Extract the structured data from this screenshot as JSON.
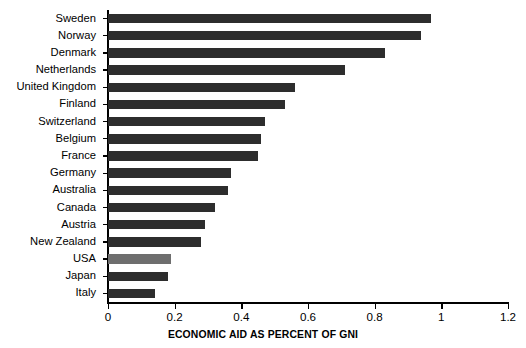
{
  "chart_data": {
    "type": "bar",
    "orientation": "horizontal",
    "title": "",
    "xlabel": "ECONOMIC AID AS PERCENT OF GNI",
    "ylabel": "",
    "xlim": [
      0,
      1.2
    ],
    "xticks": [
      "0",
      "0.2",
      "0.4",
      "0.6",
      "0.8",
      "1",
      "1.2"
    ],
    "xtick_values": [
      0,
      0.2,
      0.4,
      0.6,
      0.8,
      1,
      1.2
    ],
    "grid": false,
    "legend": "none",
    "categories": [
      "Sweden",
      "Norway",
      "Denmark",
      "Netherlands",
      "United Kingdom",
      "Finland",
      "Switzerland",
      "Belgium",
      "France",
      "Germany",
      "Australia",
      "Canada",
      "Austria",
      "New Zealand",
      "USA",
      "Japan",
      "Italy"
    ],
    "values": [
      0.97,
      0.94,
      0.83,
      0.71,
      0.56,
      0.53,
      0.47,
      0.46,
      0.45,
      0.37,
      0.36,
      0.32,
      0.29,
      0.28,
      0.19,
      0.18,
      0.14
    ],
    "bar_color": "#2d2d2d",
    "highlight_color": "#6e6e6e",
    "highlight_category": "USA"
  }
}
